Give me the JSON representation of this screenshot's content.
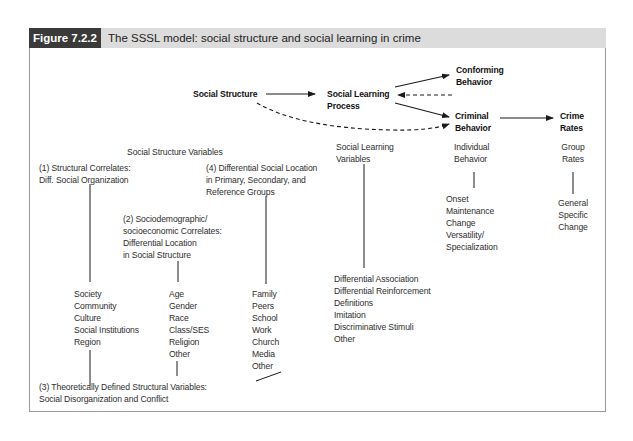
{
  "figure": {
    "label": "Figure 7.2.2",
    "title": "The SSSL model: social structure and social learning in crime"
  },
  "flow": {
    "social_structure": "Social Structure",
    "social_learning_process": "Social Learning\nProcess",
    "conforming_behavior": "Conforming\nBehavior",
    "criminal_behavior": "Criminal\nBehavior",
    "crime_rates": "Crime\nRates"
  },
  "columns": {
    "social_structure_variables": "Social Structure Variables",
    "social_learning_variables": "Social Learning\nVariables",
    "individual_behavior": "Individual\nBehavior",
    "group_rates": "Group\nRates"
  },
  "structure": {
    "structural_correlates": {
      "heading": "(1) Structural Correlates:\nDiff. Social Organization",
      "items": "Society\nCommunity\nCulture\nSocial Institutions\nRegion"
    },
    "sociodemographic": {
      "heading": "(2) Sociodemographic/\nsocioeconomic Correlates:\nDifferential Location\nin Social Structure",
      "items": "Age\nGender\nRace\nClass/SES\nReligion\nOther"
    },
    "theoretical": {
      "heading": "(3) Theoretically Defined Structural Variables:\nSocial Disorganization and Conflict"
    },
    "differential_location": {
      "heading": "(4) Differential Social Location\nin Primary, Secondary, and\nReference Groups",
      "items": "Family\nPeers\nSchool\nWork\nChurch\nMedia\nOther"
    }
  },
  "learning": {
    "items": "Differential Association\nDifferential Reinforcement\nDefinitions\nImitation\nDiscriminative Stimuli\nOther"
  },
  "individual": {
    "items": "Onset\nMaintenance\nChange\nVersatility/\nSpecialization"
  },
  "group": {
    "items": "General\nSpecific\nChange"
  }
}
